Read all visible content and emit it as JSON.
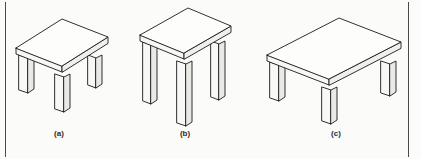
{
  "figure": {
    "name": "three-isometric-tables",
    "background_color": "#fbfbf9",
    "line_color": "#1a1a1a",
    "rule_color": "#4a4a4a",
    "width": 421,
    "height": 159,
    "border_rules": {
      "left_x": 5,
      "right_x": 408,
      "top_y": 2,
      "bottom_y": 157
    }
  },
  "items": [
    {
      "id": "a",
      "label": "(a)",
      "label_x": 59,
      "label_y": 136,
      "description": "small low table",
      "top": {
        "surface": "16,48 62,19 108,37 62,66",
        "front_edge": "16,48 16,54 62,72 62,66",
        "side_edge": "62,72 62,66 108,37 108,43"
      },
      "legs": [
        {
          "name": "leg-front-left",
          "front": "19,55 28,58 28,93 19,90",
          "side": "28,58 34,55 34,89 28,93"
        },
        {
          "name": "leg-front-right",
          "front": "55,74 64,77 64,112 55,109",
          "side": "64,77 70,74 70,108 64,112"
        },
        {
          "name": "leg-back-right",
          "front": "88,55 96,58 96,88 88,85",
          "side": "96,58 102,55 102,84 96,88"
        }
      ]
    },
    {
      "id": "b",
      "label": "(b)",
      "label_x": 185,
      "label_y": 136,
      "description": "tall narrow table",
      "top": {
        "surface": "140,35 188,8 231,26 184,53",
        "front_edge": "140,35 140,41 184,59 184,53",
        "side_edge": "184,59 184,53 231,26 231,32"
      },
      "legs": [
        {
          "name": "leg-front-left",
          "front": "143,42 151,45 151,104 143,101",
          "side": "151,45 157,42 157,100 151,104"
        },
        {
          "name": "leg-front-right",
          "front": "177,61 186,64 186,126 177,123",
          "side": "186,64 192,61 192,122 186,126"
        },
        {
          "name": "leg-back-right",
          "front": "211,41 219,44 219,100 211,97",
          "side": "219,44 225,41 225,96 219,100"
        }
      ]
    },
    {
      "id": "c",
      "label": "(c)",
      "label_x": 336,
      "label_y": 136,
      "description": "wide low table",
      "top": {
        "surface": "267,55 339,18 401,42 329,79"
      },
      "top_front_edge": "267,55 267,61 329,85 329,79",
      "top_side_edge": "329,85 329,79 401,42 401,48",
      "legs": [
        {
          "name": "leg-front-left",
          "front": "270,62 279,65 279,101 270,98",
          "side": "279,65 285,62 285,97 279,101"
        },
        {
          "name": "leg-front-right",
          "front": "322,87 331,90 331,124 322,121",
          "side": "331,90 337,87 337,120 331,124"
        },
        {
          "name": "leg-back-right",
          "front": "381,61 390,64 390,96 381,93",
          "side": "390,64 396,61 396,92 390,96"
        }
      ]
    }
  ]
}
